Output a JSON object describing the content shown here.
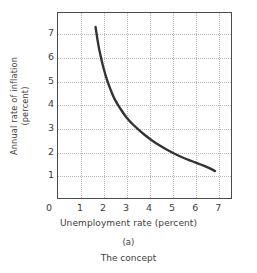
{
  "figure": {
    "panel_letter": "(a)",
    "caption": "The concept"
  },
  "chart_data": {
    "type": "line",
    "title": "",
    "subtitle": "",
    "xlabel": "Unemployment rate (percent)",
    "ylabel": "Annual rate of inflation (percent)",
    "ylabel_line1": "Annual rate of inflation",
    "ylabel_line2": "(percent)",
    "xlim": [
      0,
      7.6
    ],
    "ylim": [
      0,
      7.9
    ],
    "xticks": [
      0,
      1,
      2,
      3,
      4,
      5,
      6,
      7
    ],
    "xticklabels": [
      "0",
      "1",
      "2",
      "3",
      "4",
      "5",
      "6",
      "7"
    ],
    "yticks": [
      1,
      2,
      3,
      4,
      5,
      6,
      7
    ],
    "yticklabels": [
      "1",
      "2",
      "3",
      "4",
      "5",
      "6",
      "7"
    ],
    "grid": true,
    "grid_style": "dotted",
    "grid_color": "#b9b9b9",
    "legend": null,
    "legend_position": "none",
    "series": [
      {
        "name": "Phillips curve",
        "color": "#333333",
        "linewidth": 2.4,
        "x": [
          1.65,
          1.72,
          1.8,
          1.9,
          2.0,
          2.15,
          2.3,
          2.5,
          2.75,
          3.0,
          3.25,
          3.5,
          3.8,
          4.1,
          4.4,
          4.75,
          5.1,
          5.5,
          5.9,
          6.3,
          6.6,
          6.9
        ],
        "y": [
          7.3,
          6.85,
          6.4,
          5.95,
          5.55,
          5.05,
          4.65,
          4.2,
          3.8,
          3.45,
          3.18,
          2.95,
          2.7,
          2.48,
          2.28,
          2.08,
          1.9,
          1.72,
          1.57,
          1.42,
          1.3,
          1.15
        ]
      }
    ]
  }
}
